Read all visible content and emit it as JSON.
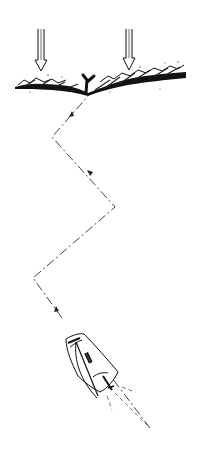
{
  "illustration": {
    "description": "Line drawing of a sailboat tacking in a zigzag course toward a rocky shoreline/reef, with two downward arrows above the shore",
    "colors": {
      "background": "#ffffff",
      "ink": "#111111",
      "path": "#444444"
    },
    "icons": {
      "arrow_left": "down-arrow-icon",
      "arrow_right": "down-arrow-icon",
      "shore": "shoreline-reef",
      "boat": "sailboat-icon",
      "course": "dash-dot-course-line"
    }
  }
}
